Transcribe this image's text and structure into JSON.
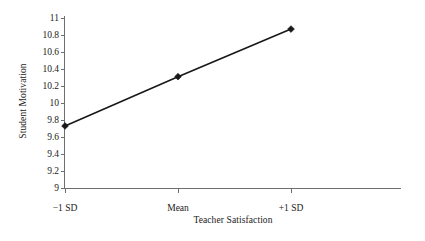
{
  "chart_data": {
    "type": "line",
    "title": "",
    "subtitle": "",
    "xlabel": "Teacher Satisfaction",
    "ylabel": "Student Motivation",
    "categories": [
      "−1 SD",
      "Mean",
      "+1 SD"
    ],
    "x": [
      0,
      1,
      2
    ],
    "values": [
      9.73,
      10.31,
      10.87
    ],
    "series": [
      {
        "name": "Student Motivation",
        "values": [
          9.73,
          10.31,
          10.87
        ],
        "color": "#181818",
        "marker": "diamond",
        "line_style": "solid"
      }
    ],
    "ylim": [
      9,
      11
    ],
    "ytick_values": [
      9,
      9.2,
      9.4,
      9.6,
      9.8,
      10,
      10.2,
      10.4,
      10.6,
      10.8,
      11
    ],
    "ytick_labels": [
      "9",
      "9.2",
      "9.4",
      "9.6",
      "9.8",
      "10",
      "10.2",
      "10.4",
      "10.6",
      "10.8",
      "11"
    ],
    "xtick_labels": [
      "−1 SD",
      "Mean",
      "+1 SD"
    ],
    "grid": false,
    "legend": false,
    "legend_position": "none",
    "axis_color": "#6e6e6e",
    "text_color": "#1a1a1a",
    "background": "#ffffff",
    "annotations": []
  }
}
